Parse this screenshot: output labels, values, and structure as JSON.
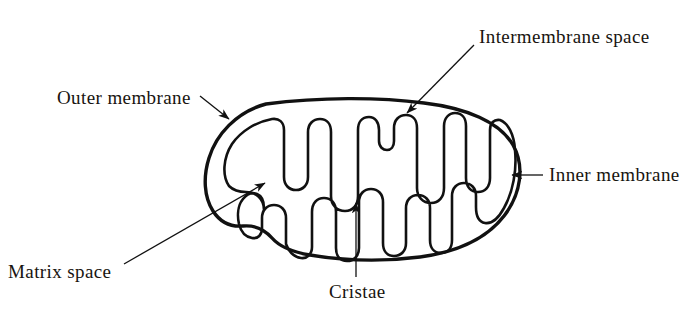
{
  "diagram": {
    "stroke_color": "#111111",
    "background_color": "#ffffff",
    "labels": {
      "outer_membrane": "Outer membrane",
      "intermembrane_space": "Intermembrane space",
      "inner_membrane": "Inner membrane",
      "matrix_space": "Matrix space",
      "cristae": "Cristae"
    }
  }
}
